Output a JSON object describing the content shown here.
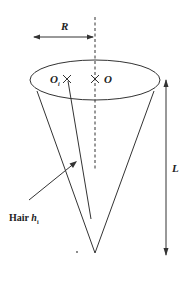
{
  "diagram": {
    "title": "",
    "labels": {
      "radius": "R",
      "center_o": "O",
      "center_oi": "O",
      "center_oi_sub": "i",
      "length": "L",
      "hair_prefix": "Hair ",
      "hair_var": "h",
      "hair_sub": "i"
    },
    "colors": {
      "line": "#333333",
      "background": "#ffffff"
    }
  }
}
